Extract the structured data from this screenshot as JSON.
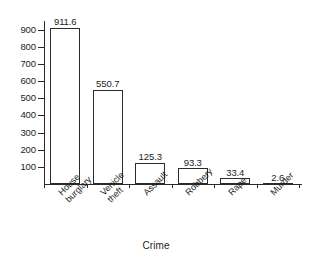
{
  "chart_data": {
    "type": "bar",
    "title": "",
    "subtitle": "",
    "xlabel": "Crime",
    "ylabel": "",
    "categories": [
      "House burglary",
      "Vehicle theft",
      "Assault",
      "Robbery",
      "Rape",
      "Murder"
    ],
    "category_lines": [
      [
        "House",
        "burglary"
      ],
      [
        "Vehicle",
        "theft"
      ],
      [
        "Assault"
      ],
      [
        "Robbery"
      ],
      [
        "Rape"
      ],
      [
        "Murder"
      ]
    ],
    "values": [
      911.6,
      550.7,
      125.3,
      93.3,
      33.4,
      2.6
    ],
    "value_labels": [
      "911.6",
      "550.7",
      "125.3",
      "93.3",
      "33.4",
      "2.6"
    ],
    "ylim": [
      0,
      950
    ],
    "yticks": [
      100,
      200,
      300,
      400,
      500,
      600,
      700,
      800,
      900
    ],
    "ytick_labels": [
      "100",
      "200",
      "300",
      "400",
      "500",
      "600",
      "700",
      "800",
      "900"
    ],
    "grid": false,
    "legend": null,
    "bar_fill_color": "#ffffff",
    "bar_edge_color": "#2b2b2b",
    "axis_color": "#2b2b2b",
    "text_color": "#1c1c1c",
    "background_color": "#ffffff"
  }
}
